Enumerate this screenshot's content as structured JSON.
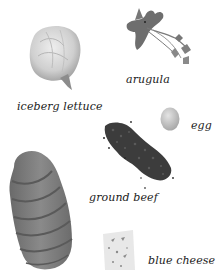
{
  "illustration": {
    "items": [
      {
        "name": "iceberg lettuce",
        "label": "iceberg lettuce"
      },
      {
        "name": "arugula",
        "label": "arugula"
      },
      {
        "name": "egg",
        "label": "egg"
      },
      {
        "name": "ground beef",
        "label": "ground beef"
      },
      {
        "name": "bread",
        "label": ""
      },
      {
        "name": "blue cheese",
        "label": "blue cheese"
      }
    ]
  },
  "colors": {
    "background": "#ffffff",
    "text": "#1a1a1a",
    "lettuce": "#c9c9c9",
    "arugula": "#6a6a6a",
    "egg": "#c8c8c8",
    "beef": "#3e3e3e",
    "bread": "#7c7c7c",
    "cheese": "#e6e6e6"
  }
}
